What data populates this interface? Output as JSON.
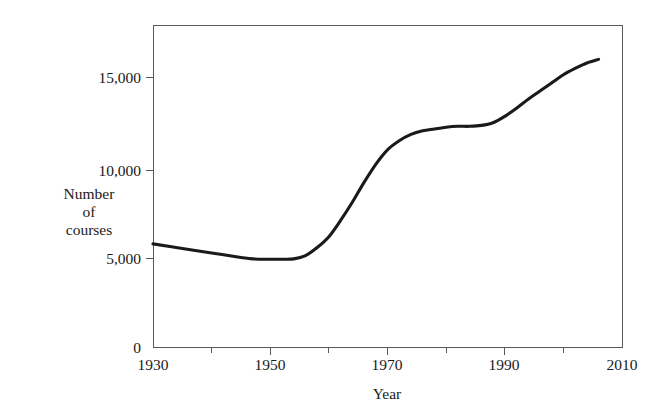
{
  "chart_data": {
    "type": "line",
    "title": "",
    "subtitle": "",
    "xlabel": "Year",
    "ylabel": "Number of courses",
    "ylabel_lines": [
      "Number",
      "of",
      "courses"
    ],
    "xlim": [
      1930,
      2010
    ],
    "ylim": [
      0,
      17800
    ],
    "grid": false,
    "legend": false,
    "legend_position": "none",
    "line_color": "#1a1a1a",
    "axis_color": "#5a5a5a",
    "background_color": "#ffffff",
    "x_ticks_major": [
      1930,
      1950,
      1970,
      1990,
      2010
    ],
    "x_tick_labels": [
      "1930",
      "1950",
      "1970",
      "1990",
      "2010"
    ],
    "x_ticks_minor": [
      1940,
      1960,
      1980,
      2000
    ],
    "y_ticks_major": [
      0,
      5000,
      10000,
      15000
    ],
    "y_tick_labels": [
      "0",
      "5,000",
      "10,000",
      "15,000"
    ],
    "series": [
      {
        "name": "Number of courses",
        "x": [
          1930,
          1935,
          1940,
          1945,
          1947,
          1950,
          1952,
          1954,
          1956,
          1958,
          1960,
          1962,
          1964,
          1966,
          1968,
          1970,
          1972,
          1974,
          1976,
          1978,
          1980,
          1982,
          1984,
          1986,
          1988,
          1990,
          1992,
          1994,
          1996,
          1998,
          2000,
          2002,
          2004,
          2006
        ],
        "values": [
          5700,
          5450,
          5200,
          4950,
          4870,
          4850,
          4850,
          4870,
          5050,
          5500,
          6100,
          7000,
          8000,
          9100,
          10100,
          10900,
          11400,
          11750,
          11950,
          12050,
          12150,
          12200,
          12200,
          12250,
          12400,
          12750,
          13200,
          13700,
          14150,
          14600,
          15050,
          15400,
          15700,
          15900
        ]
      }
    ]
  }
}
